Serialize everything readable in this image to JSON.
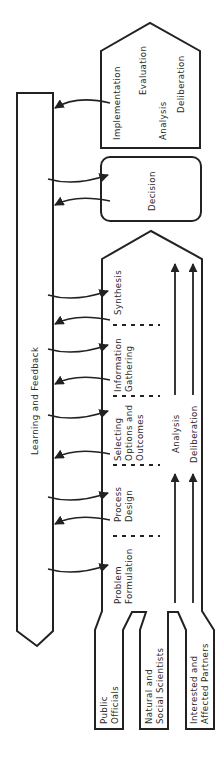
{
  "diagram": {
    "feedback_bar": {
      "label": "Learning and Feedback"
    },
    "top_stage": {
      "labels": [
        "Implementation",
        "Evaluation",
        "Analysis",
        "Deliberation"
      ]
    },
    "decision": {
      "label": "Decision"
    },
    "main_process": {
      "steps": [
        {
          "line1": "Problem",
          "line2": "Formulation"
        },
        {
          "line1": "Process",
          "line2": "Design"
        },
        {
          "line1": "Selecting",
          "line2": "Options and",
          "line3": "Outcomes"
        },
        {
          "line1": "Information",
          "line2": "Gathering"
        },
        {
          "line1": "Synthesis"
        }
      ],
      "streams": {
        "analysis": "Analysis",
        "deliberation": "Deliberation"
      }
    },
    "participants": [
      {
        "line1": "Public",
        "line2": "Officials"
      },
      {
        "line1": "Natural and",
        "line2": "Social Scientists"
      },
      {
        "line1": "Interested and",
        "line2": "Affected Partners"
      }
    ],
    "colors": {
      "stroke": "#222222",
      "text": "#2a2a2a",
      "background": "#ffffff"
    }
  }
}
